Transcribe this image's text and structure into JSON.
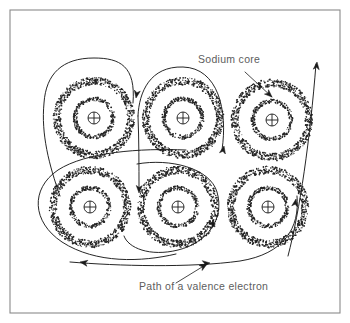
{
  "figure": {
    "background_color": "#ffffff",
    "ink_color": "#1a1a1a",
    "frame_color": "#8a8a8a",
    "label_color": "#5d5d5d",
    "frame": {
      "x": 10,
      "y": 10,
      "width": 330,
      "height": 303
    }
  },
  "labels": {
    "sodium_core": "Sodium core",
    "valence_path": "Path of a valence electron"
  },
  "annotations": [
    {
      "name": "sodium-core-annotation",
      "text": "Sodium core",
      "text_x": 198,
      "text_y": 63,
      "leader_from": [
        245,
        72
      ],
      "leader_to": [
        272,
        97
      ],
      "points_at": "outer electron shell of top-right sodium core"
    },
    {
      "name": "valence-path-annotation",
      "text": "Path of a valence electron",
      "text_x": 139,
      "text_y": 290,
      "leader_from": [
        176,
        283
      ],
      "leader_to": [
        207,
        264
      ],
      "points_at": "lower horizontal segment of the electron path"
    }
  ],
  "atoms": [
    {
      "name": "sodium-core-top-left",
      "row": 0,
      "col": 0,
      "cx": 94,
      "cy": 118,
      "outer_r": 37,
      "inner_r": 19,
      "nucleus_r": 6
    },
    {
      "name": "sodium-core-top-middle",
      "row": 0,
      "col": 1,
      "cx": 183,
      "cy": 118,
      "outer_r": 37,
      "inner_r": 19,
      "nucleus_r": 6
    },
    {
      "name": "sodium-core-top-right",
      "row": 0,
      "col": 2,
      "cx": 272,
      "cy": 120,
      "outer_r": 37,
      "inner_r": 19,
      "nucleus_r": 6
    },
    {
      "name": "sodium-core-bottom-left",
      "row": 1,
      "col": 0,
      "cx": 90,
      "cy": 207,
      "outer_r": 37,
      "inner_r": 19,
      "nucleus_r": 6
    },
    {
      "name": "sodium-core-bottom-middle",
      "row": 1,
      "col": 1,
      "cx": 178,
      "cy": 207,
      "outer_r": 37,
      "inner_r": 19,
      "nucleus_r": 6
    },
    {
      "name": "sodium-core-bottom-right",
      "row": 1,
      "col": 2,
      "cx": 268,
      "cy": 207,
      "outer_r": 37,
      "inner_r": 19,
      "nucleus_r": 6
    }
  ],
  "atom_symbol": {
    "nucleus_glyph": "plus-in-circle",
    "inner_shell": "stippled-ring",
    "outer_shell": "stippled-ring-thick"
  },
  "electron_path": {
    "description": "Continuous winding trajectory of a valence electron threading between the six sodium cores",
    "segments": [
      {
        "name": "loop-top-left",
        "d": "M 133 103 C 136 66 120 58 94 58 C 62 58 46 74 44 103 C 41 134 49 165 60 196"
      },
      {
        "name": "loop-top-middle",
        "d": "M 222 150 C 228 110 218 68 183 67 C 150 66 139 92 138 116"
      },
      {
        "name": "up-right-long",
        "d": "M 288 256 C 300 210 310 140 316 64"
      },
      {
        "name": "loop-bottom-left",
        "d": "M 186 150 C 140 148 86 152 58 170 C 30 189 32 222 62 242 C 96 264 142 262 176 254"
      },
      {
        "name": "loop-bottom-middle",
        "d": "M 137 164 C 170 158 210 168 217 192 C 225 219 207 243 178 250 C 150 257 128 248 124 236"
      },
      {
        "name": "bottom-sweep",
        "d": "M 297 196 C 300 228 284 254 240 261 C 190 268 118 266 70 262"
      },
      {
        "name": "descend-middle",
        "d": "M 138 116 C 139 140 139 165 139 190"
      }
    ],
    "arrow_heads": [
      {
        "name": "arrow-down-top-left",
        "x": 136,
        "y": 98,
        "angle": 100
      },
      {
        "name": "arrow-up-top-middle",
        "x": 224,
        "y": 146,
        "angle": -78
      },
      {
        "name": "arrow-up-right",
        "x": 317,
        "y": 62,
        "angle": -84
      },
      {
        "name": "arrow-down-middle-column",
        "x": 139,
        "y": 193,
        "angle": 92
      },
      {
        "name": "arrow-right-bottom-middle",
        "x": 215,
        "y": 227,
        "angle": 55
      },
      {
        "name": "arrow-left-bottom-left",
        "x": 80,
        "y": 262,
        "angle": 190
      },
      {
        "name": "arrow-right-bottom-path",
        "x": 210,
        "y": 263,
        "angle": -5
      },
      {
        "name": "arrow-up-bottom-right",
        "x": 296,
        "y": 199,
        "angle": -80
      }
    ]
  }
}
